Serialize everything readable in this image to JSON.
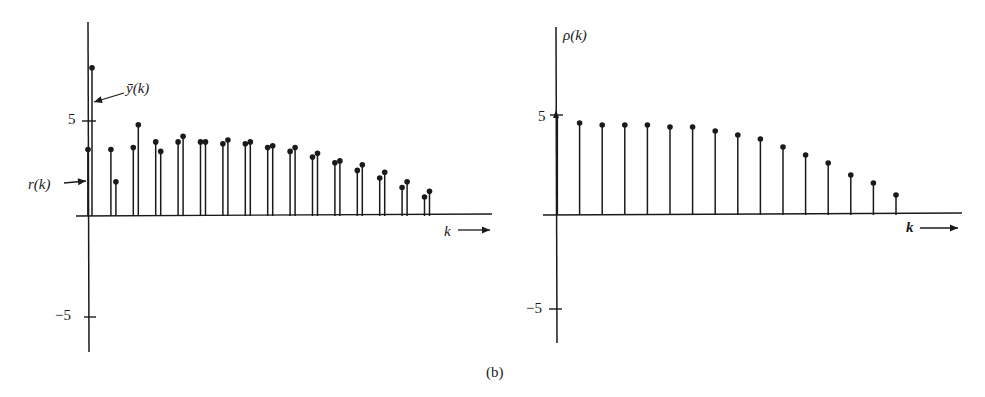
{
  "caption": "(b)",
  "chart_data": [
    {
      "type": "stem",
      "title": "",
      "xlabel": "k",
      "ylabel": "",
      "yticks": [
        "5",
        "-5"
      ],
      "ylim": [
        -7,
        8
      ],
      "annotations": [
        "ȳ(k)",
        "r(k)"
      ],
      "grid": false,
      "series": [
        {
          "name": "r(k)",
          "x": [
            0,
            1,
            2,
            3,
            4,
            5,
            6,
            7,
            8,
            9,
            10,
            11,
            12,
            13,
            14
          ],
          "values": [
            3.5,
            3.5,
            3.6,
            3.9,
            3.9,
            3.9,
            3.8,
            3.8,
            3.6,
            3.4,
            3.1,
            2.8,
            2.4,
            2.0,
            1.5,
            1.0
          ]
        },
        {
          "name": "ȳ(k)",
          "x": [
            0,
            1,
            2,
            3,
            4,
            5,
            6,
            7,
            8,
            9,
            10,
            11,
            12,
            13,
            14,
            15
          ],
          "values": [
            7.8,
            1.8,
            4.8,
            3.4,
            4.2,
            3.9,
            4.0,
            3.9,
            3.7,
            3.6,
            3.3,
            2.9,
            2.7,
            2.3,
            1.8,
            1.3
          ]
        }
      ]
    },
    {
      "type": "stem",
      "title": "",
      "xlabel": "k",
      "ylabel": "ρ(k)",
      "yticks": [
        "5",
        "-5"
      ],
      "ylim": [
        -6.5,
        10
      ],
      "grid": false,
      "series": [
        {
          "name": "ρ(k)",
          "x": [
            0,
            1,
            2,
            3,
            4,
            5,
            6,
            7,
            8,
            9,
            10,
            11,
            12,
            13,
            14,
            15
          ],
          "values": [
            5.0,
            4.6,
            4.5,
            4.5,
            4.5,
            4.4,
            4.4,
            4.2,
            4.0,
            3.8,
            3.4,
            3.0,
            2.6,
            2.0,
            1.6,
            1.0
          ]
        }
      ]
    }
  ],
  "labels": {
    "left_ytick_pos": "5",
    "left_ytick_neg": "−5",
    "left_xlabel": "k",
    "ybar": "ȳ(k)",
    "rk": "r(k)",
    "right_ytick_pos": "5",
    "right_ytick_neg": "−5",
    "right_ylabel": "ρ(k)",
    "right_xlabel": "k"
  }
}
